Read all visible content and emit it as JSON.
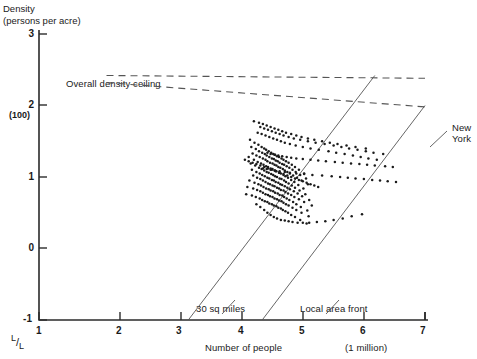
{
  "chart_data": {
    "type": "scatter",
    "title": "Density (persons per acre)",
    "ylabel_line1": "Density",
    "ylabel_line2": "(persons per acre)",
    "xlabel": "Number of people",
    "x_unit_note": "(1 million)",
    "log_note": "L/L",
    "xlim": [
      1,
      7
    ],
    "ylim": [
      -1,
      3
    ],
    "xticks": [
      1,
      2,
      3,
      4,
      5,
      6,
      7
    ],
    "xtick_labels": [
      "1",
      "2",
      "3",
      "4",
      "5",
      "6",
      "7"
    ],
    "yticks": [
      -1,
      0,
      1,
      2,
      3
    ],
    "ytick_labels": [
      "-1",
      "0",
      "1",
      "2",
      "3"
    ],
    "ytick_sublabel_2": "(100)",
    "grid": false,
    "legend": "none",
    "annotations": [
      {
        "name": "overall-density-ceiling",
        "text": "Overall density ceiling",
        "x": 1.35,
        "y": 2.28
      },
      {
        "name": "thirty-sq-miles",
        "text": "30 sq miles",
        "x": 3.35,
        "y": -0.72
      },
      {
        "name": "local-area-front",
        "text": "Local area front",
        "x": 4.55,
        "y": -0.72
      },
      {
        "name": "new-york",
        "text": "New\nYork",
        "x": 6.85,
        "y": 1.62
      }
    ],
    "reference_lines": [
      {
        "name": "ceiling-upper",
        "style": "dashed",
        "points": [
          [
            2.05,
            2.42
          ],
          [
            7.0,
            2.38
          ]
        ]
      },
      {
        "name": "ceiling-lower",
        "style": "dashed",
        "points": [
          [
            2.05,
            2.32
          ],
          [
            7.0,
            1.98
          ]
        ]
      },
      {
        "name": "thirty-sq-miles-line",
        "style": "solid",
        "points": [
          [
            3.32,
            -1.0
          ],
          [
            6.22,
            2.42
          ]
        ]
      },
      {
        "name": "local-area-front-line",
        "style": "solid",
        "points": [
          [
            4.47,
            -1.0
          ],
          [
            7.0,
            2.0
          ]
        ]
      }
    ],
    "series": [
      {
        "name": "cities",
        "marker": "dot",
        "n_points": 330,
        "x": [
          4.28,
          4.35,
          4.41,
          4.46,
          4.5,
          4.53,
          4.57,
          4.61,
          4.64,
          4.67,
          4.7,
          4.73,
          4.77,
          4.8,
          4.84,
          4.88,
          4.93,
          4.98,
          5.04,
          5.12,
          4.3,
          4.37,
          4.42,
          4.47,
          4.51,
          4.54,
          4.58,
          4.62,
          4.65,
          4.68,
          4.71,
          4.74,
          4.78,
          4.81,
          4.85,
          4.89,
          4.94,
          4.99,
          5.06,
          5.15,
          4.32,
          4.38,
          4.43,
          4.48,
          4.52,
          4.55,
          4.59,
          4.63,
          4.66,
          4.69,
          4.72,
          4.75,
          4.79,
          4.82,
          4.86,
          4.9,
          4.95,
          5.01,
          5.08,
          5.18,
          4.26,
          4.34,
          4.4,
          4.45,
          4.49,
          4.53,
          4.56,
          4.6,
          4.63,
          4.66,
          4.69,
          4.73,
          4.76,
          4.8,
          4.83,
          4.87,
          4.92,
          4.97,
          5.03,
          5.11,
          4.29,
          4.36,
          4.42,
          4.46,
          4.5,
          4.54,
          4.57,
          4.61,
          4.64,
          4.67,
          4.7,
          4.74,
          4.77,
          4.81,
          4.84,
          4.88,
          4.93,
          4.98,
          5.05,
          5.14,
          4.31,
          4.38,
          4.43,
          4.47,
          4.51,
          4.55,
          4.58,
          4.62,
          4.65,
          4.68,
          4.72,
          4.75,
          4.78,
          4.82,
          4.86,
          4.9,
          4.96,
          5.02,
          5.09,
          5.2,
          4.33,
          4.39,
          4.44,
          4.48,
          4.52,
          4.56,
          4.59,
          4.63,
          4.66,
          4.7,
          4.73,
          4.76,
          4.8,
          4.83,
          4.87,
          4.92,
          4.97,
          5.04,
          5.12,
          5.24,
          4.27,
          4.35,
          4.41,
          4.45,
          4.49,
          4.53,
          4.57,
          4.6,
          4.64,
          4.67,
          4.71,
          4.74,
          4.78,
          4.81,
          4.85,
          4.89,
          4.95,
          5.0,
          5.07,
          5.17,
          4.24,
          4.33,
          4.39,
          4.44,
          4.48,
          4.52,
          4.56,
          4.59,
          4.63,
          4.66,
          4.7,
          4.73,
          4.77,
          4.8,
          4.84,
          4.88,
          4.94,
          5.0,
          5.08,
          5.19,
          4.22,
          4.31,
          4.37,
          4.43,
          4.47,
          4.51,
          4.55,
          4.58,
          4.62,
          4.65,
          4.69,
          4.72,
          4.76,
          4.79,
          4.83,
          4.87,
          4.92,
          4.98,
          5.06,
          5.16,
          4.4,
          4.46,
          4.52,
          4.58,
          4.64,
          4.7,
          4.76,
          4.82,
          4.9,
          4.99,
          5.1,
          5.22,
          5.35,
          5.5,
          5.62,
          5.75,
          5.88,
          6.0,
          6.12,
          6.25,
          4.44,
          4.5,
          4.56,
          4.62,
          4.68,
          4.74,
          4.8,
          4.88,
          4.96,
          5.06,
          5.18,
          5.3,
          5.44,
          5.58,
          5.7,
          5.82,
          5.95,
          6.08,
          6.2,
          6.35,
          4.55,
          4.6,
          4.66,
          4.72,
          4.78,
          4.85,
          4.92,
          5.0,
          5.1,
          5.22,
          5.34,
          5.46,
          5.6,
          5.72,
          5.85,
          5.98,
          6.1,
          6.22,
          6.38,
          6.5,
          4.48,
          4.54,
          4.6,
          4.67,
          4.74,
          4.82,
          4.9,
          5.0,
          5.12,
          5.25,
          5.4,
          5.55,
          5.68,
          5.8,
          5.92,
          6.05,
          6.18,
          6.3,
          6.42,
          6.55,
          4.2,
          4.26,
          4.32,
          4.38,
          4.44,
          4.5,
          4.56,
          4.62,
          4.68,
          4.74,
          4.8,
          4.86,
          4.92,
          4.98,
          5.04,
          5.1,
          5.16,
          5.22,
          5.28,
          5.34,
          4.38,
          4.44,
          4.5,
          4.55,
          4.6,
          4.65,
          4.7,
          4.76,
          4.82,
          4.88,
          4.94,
          5.02,
          5.1,
          5.2,
          5.32,
          5.45,
          5.58,
          5.72,
          5.86,
          6.02,
          4.34,
          4.42,
          4.48,
          4.54,
          4.6,
          4.66,
          4.72,
          4.78,
          4.84,
          4.92,
          5.0,
          5.08,
          5.18,
          5.28,
          5.4,
          5.52,
          5.64,
          5.78,
          5.92,
          6.08
        ],
        "y": [
          1.52,
          1.48,
          1.45,
          1.42,
          1.4,
          1.38,
          1.36,
          1.34,
          1.32,
          1.31,
          1.29,
          1.28,
          1.26,
          1.24,
          1.22,
          1.2,
          1.17,
          1.14,
          1.1,
          1.05,
          1.42,
          1.39,
          1.36,
          1.34,
          1.32,
          1.3,
          1.28,
          1.26,
          1.25,
          1.23,
          1.22,
          1.2,
          1.18,
          1.17,
          1.15,
          1.13,
          1.1,
          1.07,
          1.03,
          0.98,
          1.33,
          1.3,
          1.28,
          1.26,
          1.24,
          1.22,
          1.2,
          1.19,
          1.17,
          1.16,
          1.14,
          1.13,
          1.11,
          1.09,
          1.07,
          1.05,
          1.02,
          0.99,
          0.95,
          0.9,
          1.28,
          1.24,
          1.21,
          1.19,
          1.17,
          1.15,
          1.14,
          1.12,
          1.11,
          1.09,
          1.08,
          1.06,
          1.05,
          1.03,
          1.01,
          0.99,
          0.96,
          0.93,
          0.89,
          0.84,
          1.19,
          1.16,
          1.13,
          1.11,
          1.09,
          1.07,
          1.06,
          1.04,
          1.03,
          1.01,
          1.0,
          0.98,
          0.97,
          0.95,
          0.93,
          0.91,
          0.88,
          0.85,
          0.81,
          0.76,
          1.1,
          1.07,
          1.05,
          1.03,
          1.01,
          0.99,
          0.98,
          0.96,
          0.95,
          0.93,
          0.92,
          0.9,
          0.89,
          0.87,
          0.85,
          0.83,
          0.8,
          0.77,
          0.73,
          0.68,
          1.02,
          0.99,
          0.97,
          0.95,
          0.93,
          0.91,
          0.9,
          0.88,
          0.87,
          0.85,
          0.84,
          0.82,
          0.81,
          0.79,
          0.77,
          0.75,
          0.72,
          0.69,
          0.65,
          0.6,
          0.95,
          0.92,
          0.9,
          0.88,
          0.86,
          0.84,
          0.83,
          0.81,
          0.8,
          0.78,
          0.77,
          0.75,
          0.74,
          0.72,
          0.7,
          0.68,
          0.65,
          0.62,
          0.58,
          0.53,
          0.86,
          0.84,
          0.82,
          0.8,
          0.78,
          0.76,
          0.75,
          0.73,
          0.72,
          0.7,
          0.69,
          0.67,
          0.66,
          0.64,
          0.62,
          0.6,
          0.57,
          0.54,
          0.5,
          0.45,
          0.76,
          0.74,
          0.72,
          0.7,
          0.68,
          0.66,
          0.65,
          0.63,
          0.62,
          0.6,
          0.59,
          0.57,
          0.56,
          0.54,
          0.52,
          0.5,
          0.47,
          0.44,
          0.4,
          0.35,
          1.62,
          1.6,
          1.58,
          1.56,
          1.54,
          1.52,
          1.5,
          1.48,
          1.46,
          1.44,
          1.42,
          1.4,
          1.38,
          1.36,
          1.34,
          1.32,
          1.3,
          1.28,
          1.26,
          1.24,
          1.7,
          1.68,
          1.66,
          1.64,
          1.62,
          1.6,
          1.58,
          1.56,
          1.54,
          1.52,
          1.5,
          1.48,
          1.46,
          1.44,
          1.42,
          1.4,
          1.38,
          1.36,
          1.34,
          1.32,
          1.34,
          1.32,
          1.31,
          1.3,
          1.29,
          1.28,
          1.27,
          1.26,
          1.25,
          1.24,
          1.23,
          1.22,
          1.21,
          1.2,
          1.19,
          1.18,
          1.17,
          1.16,
          1.15,
          1.14,
          1.12,
          1.11,
          1.1,
          1.09,
          1.08,
          1.07,
          1.06,
          1.05,
          1.04,
          1.03,
          1.02,
          1.01,
          1.0,
          0.99,
          0.98,
          0.97,
          0.96,
          0.95,
          0.94,
          0.93,
          1.24,
          1.22,
          1.2,
          1.18,
          1.16,
          1.14,
          1.12,
          1.1,
          1.08,
          1.06,
          1.04,
          1.02,
          1.0,
          0.98,
          0.96,
          0.94,
          0.92,
          0.9,
          0.88,
          0.86,
          0.62,
          0.58,
          0.54,
          0.5,
          0.47,
          0.44,
          0.42,
          0.4,
          0.39,
          0.38,
          0.37,
          0.36,
          0.36,
          0.36,
          0.37,
          0.38,
          0.4,
          0.42,
          0.45,
          0.48,
          1.78,
          1.76,
          1.74,
          1.72,
          1.7,
          1.68,
          1.66,
          1.64,
          1.62,
          1.6,
          1.58,
          1.56,
          1.54,
          1.52,
          1.5,
          1.48,
          1.46,
          1.44,
          1.42,
          1.4
        ]
      }
    ]
  }
}
